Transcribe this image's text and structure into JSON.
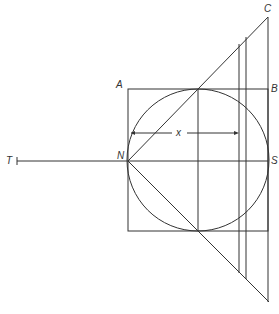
{
  "diagram": {
    "labels": {
      "A": "A",
      "B": "B",
      "C": "C",
      "N": "N",
      "S": "S",
      "T": "T",
      "x": "x"
    },
    "colors": {
      "line": "#333333",
      "background": "#ffffff"
    }
  }
}
